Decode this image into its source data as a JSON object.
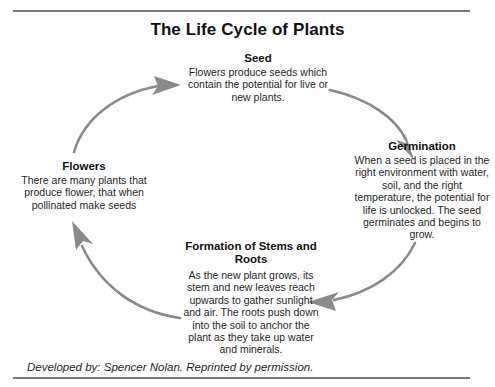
{
  "document": {
    "title": "The Life Cycle of Plants",
    "credit": "Developed by: Spencer Nolan. Reprinted by permission."
  },
  "colors": {
    "arrow": "#8a8a8a",
    "rule": "#7a7a7a",
    "text": "#1f1f1f",
    "heading": "#111111",
    "background": "#ffffff"
  },
  "diagram": {
    "type": "cycle",
    "direction": "clockwise",
    "nodes": [
      {
        "id": "seed",
        "position": "top",
        "title": "Seed",
        "body": "Flowers produce seeds which contain the potential for live or new plants."
      },
      {
        "id": "germination",
        "position": "right",
        "title": "Germination",
        "body": "When a seed is placed in the right environment with water, soil, and the right temperature, the potential for life is unlocked. The seed germinates and begins to grow."
      },
      {
        "id": "formation",
        "position": "bottom",
        "title": "Formation of Stems and Roots",
        "body": "As the new plant grows, its stem and new leaves reach upwards to gather sunlight and air. The roots push down into the soil to anchor the plant as they take up water and minerals."
      },
      {
        "id": "flowers",
        "position": "left",
        "title": "Flowers",
        "body": "There are many plants that produce flower, that when pollinated make seeds"
      }
    ],
    "arrows": [
      {
        "id": "flowers-to-seed",
        "from": "flowers",
        "to": "seed",
        "label": "arc-arrow-up-right"
      },
      {
        "id": "seed-to-germination",
        "from": "seed",
        "to": "germination",
        "label": "arc-arrow-down-right"
      },
      {
        "id": "germination-to-formation",
        "from": "germination",
        "to": "formation",
        "label": "arc-arrow-down-left"
      },
      {
        "id": "formation-to-flowers",
        "from": "formation",
        "to": "flowers",
        "label": "arc-arrow-up-left"
      }
    ]
  }
}
